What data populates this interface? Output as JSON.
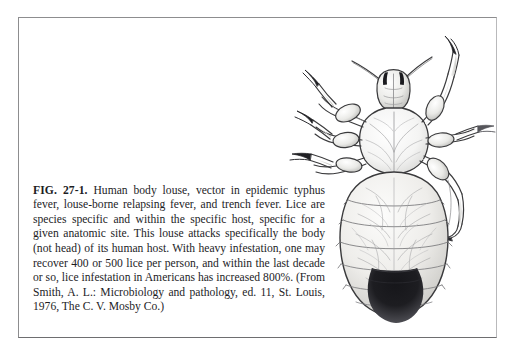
{
  "page": {
    "background_color": "#ffffff",
    "frame_color": "#8d8d8f"
  },
  "figure": {
    "number": "FIG. 27-1.",
    "caption_label": "FIG. 27-1.",
    "caption_body": " Human body louse, vector in epidemic typhus fever, louse-borne relapsing fever, and trench fever. Lice are species specific and within the specific host, specific for a given anatomic site. This louse attacks specifically the body (not head) of its human host. With heavy infestation, one may recover 400 or 500 lice per person, and within the last decade or so, lice infestation in Americans has increased 800%. (From Smith, A. L.: Microbiology and pathology, ed. 11, St. Louis, 1976, The C. V. Mosby Co.)",
    "caption_full": "FIG. 27-1. Human body louse, vector in epidemic typhus fever, louse-borne relapsing fever, and trench fever. Lice are species specific and within the specific host, specific for a given anatomic site. This louse attacks specifically the body (not head) of its human host. With heavy infestation, one may recover 400 or 500 lice per person, and within the last decade or so, lice infestation in Americans has increased 800%. (From Smith, A. L.: Microbiology and pathology, ed. 11, St. Louis, 1976, The C. V. Mosby Co.)",
    "caption_lines": [
      "FIG. 27-1. Human body louse, vector in epidemic typhus",
      "fever, louse-borne relapsing fever, and trench fever.",
      "Lice are species specific and within the specific host,",
      "specific for a given anatomic site. This louse attacks spe-",
      "cifically the body (not head) of its human host. With",
      "heavy infestation, one may recover 400 or 500 lice per",
      "person, and within the last decade or so, lice infestation",
      "in Americans has increased 800%. (From Smith, A. L.:",
      "Microbiology and pathology, ed. 11, St. Louis, 1976,",
      "The C. V. Mosby Co.)"
    ],
    "source": {
      "author": "Smith, A. L.",
      "title": "Microbiology and pathology",
      "edition": "ed. 11",
      "city": "St. Louis",
      "year": "1976",
      "publisher": "The C. V. Mosby Co."
    },
    "statistics": {
      "lice_per_person_low": "400",
      "lice_per_person_high": "500",
      "increase_percent": "800%"
    },
    "illustration": {
      "subject": "human-body-louse",
      "view": "ventral",
      "ink_color": "#3a3a3c",
      "parts": [
        "head",
        "antenna-left",
        "antenna-right",
        "eye-spot-left",
        "eye-spot-right",
        "thorax",
        "abdomen",
        "leg-fore-left",
        "leg-mid-left",
        "leg-hind-left",
        "leg-fore-right",
        "leg-mid-right",
        "leg-hind-right",
        "abdomen-dark-tip"
      ]
    }
  }
}
